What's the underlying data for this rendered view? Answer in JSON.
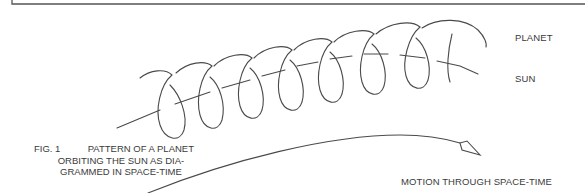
{
  "labels": {
    "planet": "PLANET",
    "sun": "SUN",
    "motion": "MOTION THROUGH SPACE-TIME"
  },
  "caption": {
    "fig_number": "FIG. 1",
    "line1": "PATTERN OF A PLANET",
    "line2": "ORBITING THE SUN AS DIA-",
    "line3": "GRAMMED IN SPACE-TIME"
  },
  "diagram": {
    "loop_count": 8,
    "stroke_color": "#4a4a4a"
  }
}
